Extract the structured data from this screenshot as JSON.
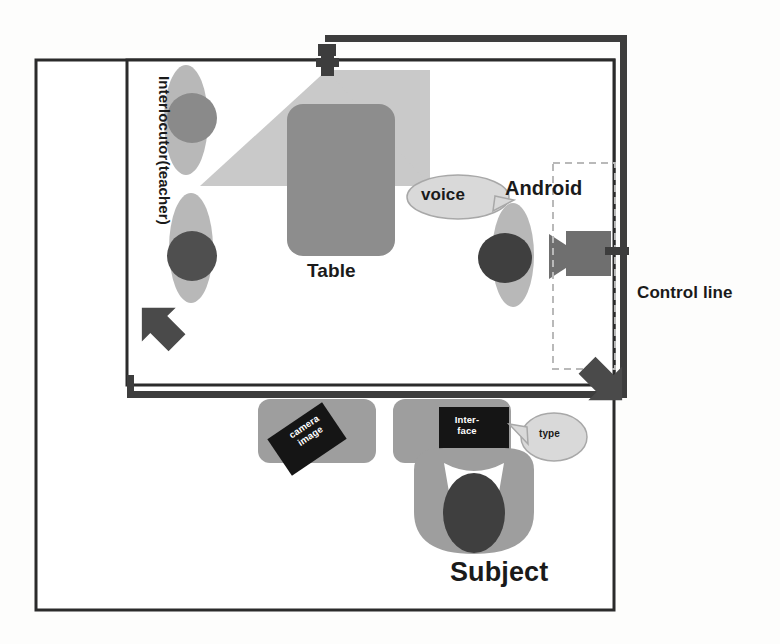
{
  "diagram": {
    "labels": {
      "interlocutor": "Interlocutor(teacher)",
      "table": "Table",
      "android": "Android",
      "voice": "voice",
      "control_line": "Control line",
      "camera_image": "camera\nimage",
      "camera_image_line1": "camera",
      "camera_image_line2": "image",
      "interface_line1": "Inter-",
      "interface_line2": "face",
      "type": "type",
      "subject": "Subject"
    },
    "icons": {
      "ceiling_camera": "camera-icon",
      "android_camera": "camera-icon",
      "arrow_upleft": "arrow-up-left-icon",
      "arrow_downright": "arrow-down-right-icon",
      "speech_bubble_voice": "speech-bubble-icon",
      "speech_bubble_type": "speech-bubble-icon"
    },
    "colors": {
      "outline": "#2b2b2b",
      "control_line": "#3d3d3d",
      "table_fill": "#8d8d8d",
      "person_body": "#b4b4b4",
      "person_head_dark": "#4f4f4f",
      "person_head_mid": "#8a8a8a",
      "camera_cone": "#c9c9c9",
      "desk_fill": "#9e9e9e",
      "screen_fill": "#151515",
      "bubble_fill": "#d9d9d9",
      "background": "#fdfdfc"
    }
  }
}
